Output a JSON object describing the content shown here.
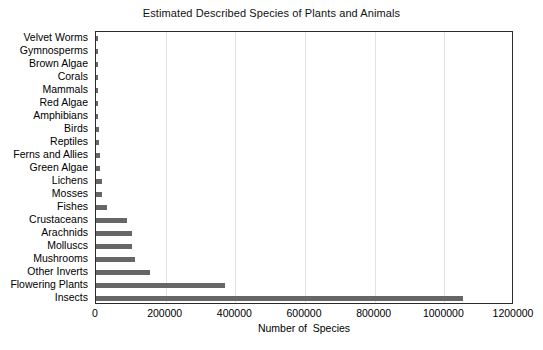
{
  "chart_data": {
    "type": "bar",
    "orientation": "horizontal",
    "title": "Estimated Described Species of Plants and Animals",
    "xlabel": "Number of  Species",
    "ylabel": "",
    "xlim": [
      0,
      1200000
    ],
    "xticks": [
      0,
      200000,
      400000,
      600000,
      800000,
      1000000,
      1200000
    ],
    "xticklabels": [
      "0",
      "200000",
      "400000",
      "600000",
      "800000",
      "1000000",
      "1200000"
    ],
    "grid": "vertical",
    "legend": "none",
    "bar_color": "#666666",
    "categories": [
      "Velvet Worms",
      "Gymnosperms",
      "Brown Algae",
      "Corals",
      "Mammals",
      "Red Algae",
      "Amphibians",
      "Birds",
      "Reptiles",
      "Ferns and Allies",
      "Green Algae",
      "Lichens",
      "Mosses",
      "Fishes",
      "Crustaceans",
      "Arachnids",
      "Molluscs",
      "Mushrooms",
      "Other Inverts",
      "Flowering Plants",
      "Insects"
    ],
    "values": [
      165,
      1021,
      3067,
      2175,
      5487,
      6144,
      6199,
      9990,
      9084,
      12000,
      12272,
      17000,
      16236,
      31300,
      89000,
      102248,
      103000,
      113000,
      155000,
      370000,
      1055000
    ]
  }
}
